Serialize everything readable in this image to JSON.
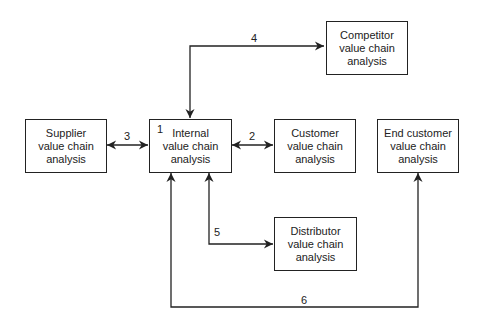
{
  "diagram": {
    "boxes": [
      {
        "id": "competitor",
        "label": "Competitor\nvalue chain\nanalysis"
      },
      {
        "id": "supplier",
        "label": "Supplier\nvalue chain\nanalysis"
      },
      {
        "id": "internal",
        "label": "Internal\nvalue chain\nanalysis",
        "number": "1"
      },
      {
        "id": "customer",
        "label": "Customer\nvalue chain\nanalysis"
      },
      {
        "id": "end_customer",
        "label": "End customer\nvalue chain\nanalysis"
      },
      {
        "id": "distributor",
        "label": "Distributor\nvalue chain\nanalysis"
      }
    ],
    "links": [
      {
        "label": "2",
        "from": "internal",
        "to": "customer"
      },
      {
        "label": "3",
        "from": "internal",
        "to": "supplier"
      },
      {
        "label": "4",
        "from": "internal",
        "to": "competitor"
      },
      {
        "label": "5",
        "from": "internal",
        "to": "distributor"
      },
      {
        "label": "6",
        "from": "internal",
        "to": "end_customer"
      }
    ]
  }
}
